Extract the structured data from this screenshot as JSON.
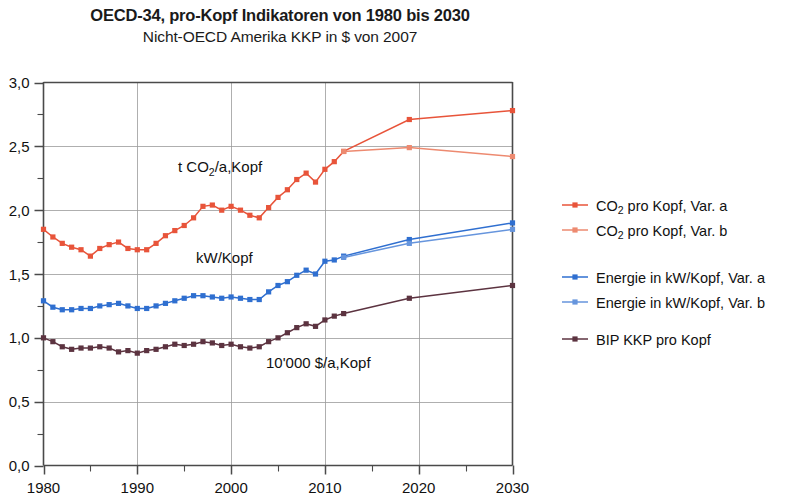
{
  "header": {
    "title": "OECD-34, pro-Kopf Indikatoren von 1980 bis 2030",
    "subtitle": "Nicht-OECD Amerika KKP in $ von 2007"
  },
  "axes": {
    "y_ticks": [
      "0,0",
      "0,5",
      "1,0",
      "1,5",
      "2,0",
      "2,5",
      "3,0"
    ],
    "x_ticks": [
      "1980",
      "1990",
      "2000",
      "2010",
      "2020",
      "2030"
    ]
  },
  "annotations": {
    "co2": {
      "pre": "t CO",
      "sub": "2",
      "post": "/a,Kopf"
    },
    "energy": {
      "text": "kW/Kopf"
    },
    "gdp": {
      "text": "10'000 $/a,Kopf"
    }
  },
  "legend": {
    "items": [
      {
        "pre": "CO",
        "sub": "2",
        "post": " pro Kopf, Var. a",
        "color": "#e8543a",
        "key": "co2_a"
      },
      {
        "pre": "CO",
        "sub": "2",
        "post": " pro Kopf, Var. b",
        "color": "#ed8a70",
        "key": "co2_b"
      },
      {
        "pre": "",
        "sub": "",
        "post": "Energie in kW/Kopf, Var. a",
        "color": "#2f6fd0",
        "key": "energy_a"
      },
      {
        "pre": "",
        "sub": "",
        "post": "Energie in kW/Kopf, Var. b",
        "color": "#6695dd",
        "key": "energy_b"
      },
      {
        "pre": "",
        "sub": "",
        "post": "BIP KKP pro Kopf",
        "color": "#5c3340",
        "key": "gdp"
      }
    ]
  },
  "colors": {
    "co2_a": "#e8543a",
    "co2_b": "#ed8a70",
    "energy_a": "#2f6fd0",
    "energy_b": "#6695dd",
    "gdp": "#5c3340",
    "axis": "#4a4a4a",
    "grid": "#9a9a9a",
    "background": "#ffffff"
  },
  "chart_data": {
    "type": "line",
    "title": "OECD-34, pro-Kopf Indikatoren von 1980 bis 2030",
    "subtitle": "Nicht-OECD Amerika KKP in $ von 2007",
    "xlabel": "",
    "ylabel": "",
    "xlim": [
      1980,
      2030
    ],
    "ylim": [
      0.0,
      3.0
    ],
    "y_tick_step": 0.5,
    "y_minor_step": 0.25,
    "x_tick_step": 10,
    "x_minor_step": 5,
    "grid": "horizontal-and-vertical-major",
    "legend_position": "right",
    "markers": "square",
    "series": [
      {
        "name": "CO2 pro Kopf, Var. a",
        "color": "#e8543a",
        "unit": "t CO2/a,Kopf",
        "x": [
          1980,
          1981,
          1982,
          1983,
          1984,
          1985,
          1986,
          1987,
          1988,
          1989,
          1990,
          1991,
          1992,
          1993,
          1994,
          1995,
          1996,
          1997,
          1998,
          1999,
          2000,
          2001,
          2002,
          2003,
          2004,
          2005,
          2006,
          2007,
          2008,
          2009,
          2010,
          2011,
          2012,
          2019,
          2030
        ],
        "y": [
          1.85,
          1.79,
          1.74,
          1.71,
          1.69,
          1.64,
          1.7,
          1.73,
          1.75,
          1.7,
          1.69,
          1.69,
          1.74,
          1.8,
          1.84,
          1.88,
          1.94,
          2.03,
          2.04,
          2.0,
          2.03,
          2.0,
          1.96,
          1.94,
          2.02,
          2.1,
          2.16,
          2.24,
          2.29,
          2.22,
          2.32,
          2.38,
          2.46,
          2.71,
          2.78
        ]
      },
      {
        "name": "CO2 pro Kopf, Var. b",
        "color": "#ed8a70",
        "unit": "t CO2/a,Kopf",
        "x": [
          2012,
          2019,
          2030
        ],
        "y": [
          2.46,
          2.49,
          2.42
        ]
      },
      {
        "name": "Energie in kW/Kopf, Var. a",
        "color": "#2f6fd0",
        "unit": "kW/Kopf",
        "x": [
          1980,
          1981,
          1982,
          1983,
          1984,
          1985,
          1986,
          1987,
          1988,
          1989,
          1990,
          1991,
          1992,
          1993,
          1994,
          1995,
          1996,
          1997,
          1998,
          1999,
          2000,
          2001,
          2002,
          2003,
          2004,
          2005,
          2006,
          2007,
          2008,
          2009,
          2010,
          2011,
          2012,
          2019,
          2030
        ],
        "y": [
          1.29,
          1.24,
          1.22,
          1.22,
          1.23,
          1.23,
          1.25,
          1.26,
          1.27,
          1.25,
          1.23,
          1.23,
          1.25,
          1.27,
          1.29,
          1.31,
          1.33,
          1.33,
          1.32,
          1.31,
          1.32,
          1.31,
          1.3,
          1.3,
          1.36,
          1.41,
          1.44,
          1.49,
          1.53,
          1.5,
          1.6,
          1.61,
          1.64,
          1.77,
          1.9
        ]
      },
      {
        "name": "Energie in kW/Kopf, Var. b",
        "color": "#6695dd",
        "unit": "kW/Kopf",
        "x": [
          2012,
          2019,
          2030
        ],
        "y": [
          1.63,
          1.74,
          1.85
        ]
      },
      {
        "name": "BIP KKP pro Kopf",
        "color": "#5c3340",
        "unit": "10'000 $/a,Kopf",
        "x": [
          1980,
          1981,
          1982,
          1983,
          1984,
          1985,
          1986,
          1987,
          1988,
          1989,
          1990,
          1991,
          1992,
          1993,
          1994,
          1995,
          1996,
          1997,
          1998,
          1999,
          2000,
          2001,
          2002,
          2003,
          2004,
          2005,
          2006,
          2007,
          2008,
          2009,
          2010,
          2011,
          2012,
          2019,
          2030
        ],
        "y": [
          1.0,
          0.97,
          0.93,
          0.91,
          0.92,
          0.92,
          0.93,
          0.92,
          0.89,
          0.9,
          0.88,
          0.9,
          0.91,
          0.93,
          0.95,
          0.94,
          0.95,
          0.97,
          0.96,
          0.94,
          0.95,
          0.93,
          0.92,
          0.93,
          0.97,
          1.0,
          1.04,
          1.08,
          1.11,
          1.09,
          1.14,
          1.17,
          1.19,
          1.31,
          1.41
        ]
      }
    ]
  }
}
